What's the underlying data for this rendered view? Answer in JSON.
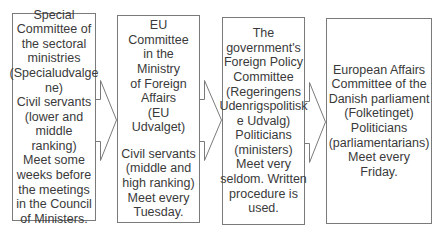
{
  "diagram": {
    "boxes": [
      {
        "title": "Special\nCommittee of\nthe sectoral\nministries\n(Specialudvalge\nne)",
        "details": "Civil servants\n(lower and\nmiddle ranking)\nMeet some\nweeks before\nthe meetings\nin the Council\nof Ministers."
      },
      {
        "title": "EU Committee\nin the Ministry\nof Foreign\nAffairs\n(EU Udvalget)",
        "details": "Civil servants\n(middle and\nhigh ranking)\nMeet every\nTuesday."
      },
      {
        "title": "The\ngovernment's\nForeign Policy\nCommittee\n(Regeringens\nUdenrigspolitisk\ne Udvalg)\nPoliticians\n(ministers)\nMeet very\nseldom. Written\nprocedure is\nused."
      },
      {
        "title": "European Affairs\nCommittee of the\nDanish parliament\n(Folketinget)\nPoliticians\n(parliamentarians)\nMeet every Friday."
      }
    ],
    "arrows": [
      {
        "from": 1,
        "to": 2
      },
      {
        "from": 2,
        "to": 3
      },
      {
        "from": 3,
        "to": 4
      }
    ],
    "colors": {
      "border": "#7a7a7a",
      "text": "#3a3a3a",
      "background": "#ffffff"
    }
  }
}
